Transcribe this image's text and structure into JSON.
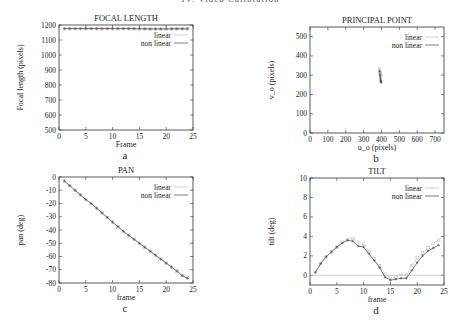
{
  "header": {
    "text": "IV. Video Calibration"
  },
  "chart_data": [
    {
      "id": "focal",
      "type": "line",
      "title": "FOCAL LENGTH",
      "xlabel": "Frame",
      "ylabel": "Focal length (pixels)",
      "caption": "a",
      "xlim": [
        0,
        25
      ],
      "ylim": [
        500,
        1200
      ],
      "xticks": [
        0,
        5,
        10,
        15,
        20,
        25
      ],
      "yticks": [
        500,
        600,
        700,
        800,
        900,
        1000,
        1100,
        1200
      ],
      "grid": false,
      "legend_position": "upper right",
      "frame": {
        "left": 59,
        "right": 193,
        "top": 25,
        "bottom": 130
      },
      "series": [
        {
          "name": "linear",
          "color": "#bbbbbb",
          "x": [
            1,
            2,
            3,
            4,
            5,
            6,
            7,
            8,
            9,
            10,
            11,
            12,
            13,
            14,
            15,
            16,
            17,
            18,
            19,
            20,
            21,
            22,
            23,
            24
          ],
          "y": [
            1175,
            1175,
            1175,
            1175,
            1175,
            1175,
            1175,
            1175,
            1175,
            1175,
            1175,
            1175,
            1175,
            1175,
            1174,
            1174,
            1173,
            1173,
            1173,
            1173,
            1173,
            1174,
            1174,
            1174
          ]
        },
        {
          "name": "non linear",
          "color": "#444444",
          "x": [
            1,
            2,
            3,
            4,
            5,
            6,
            7,
            8,
            9,
            10,
            11,
            12,
            13,
            14,
            15,
            16,
            17,
            18,
            19,
            20,
            21,
            22,
            23,
            24
          ],
          "y": [
            1176,
            1176,
            1176,
            1176,
            1176,
            1176,
            1176,
            1176,
            1176,
            1176,
            1176,
            1176,
            1176,
            1176,
            1175,
            1175,
            1174,
            1174,
            1174,
            1174,
            1175,
            1175,
            1175,
            1175
          ]
        }
      ]
    },
    {
      "id": "principal",
      "type": "scatter",
      "title": "PRINCIPAL POINT",
      "xlabel": "u_o (pixels)",
      "ylabel": "v_o (pixels)",
      "caption": "b",
      "xlim": [
        0,
        750
      ],
      "ylim": [
        0,
        550
      ],
      "xticks": [
        0,
        100,
        200,
        300,
        400,
        500,
        600,
        700
      ],
      "yticks": [
        0,
        100,
        200,
        300,
        400,
        500
      ],
      "grid": false,
      "legend_position": "upper right",
      "frame": {
        "left": 310,
        "right": 444,
        "top": 27,
        "bottom": 133
      },
      "series": [
        {
          "name": "linear",
          "color": "#bbbbbb",
          "x": [
            388,
            390,
            392,
            394,
            395,
            396
          ],
          "y": [
            335,
            325,
            315,
            305,
            300,
            295
          ]
        },
        {
          "name": "non linear",
          "color": "#444444",
          "x": [
            390,
            392,
            394,
            395,
            396,
            397,
            398
          ],
          "y": [
            320,
            300,
            285,
            275,
            270,
            265,
            262
          ]
        }
      ]
    },
    {
      "id": "pan",
      "type": "line",
      "title": "PAN",
      "xlabel": "frame",
      "ylabel": "pan (deg)",
      "caption": "c",
      "xlim": [
        0,
        25
      ],
      "ylim": [
        -80,
        0
      ],
      "xticks": [
        0,
        5,
        10,
        15,
        20,
        25
      ],
      "yticks": [
        0,
        -10,
        -20,
        -30,
        -40,
        -50,
        -60,
        -70,
        -80
      ],
      "grid": false,
      "legend_position": "upper right",
      "frame": {
        "left": 59,
        "right": 193,
        "top": 177,
        "bottom": 283
      },
      "series": [
        {
          "name": "linear",
          "color": "#bbbbbb",
          "x": [
            1,
            2,
            3,
            4,
            5,
            6,
            7,
            8,
            9,
            10,
            11,
            12,
            13,
            14,
            15,
            16,
            17,
            18,
            19,
            20,
            21,
            22,
            23,
            24
          ],
          "y": [
            -3,
            -6.5,
            -10,
            -13.5,
            -17,
            -20,
            -23.5,
            -27,
            -30.5,
            -34,
            -37.5,
            -41,
            -44,
            -47,
            -50,
            -53,
            -56,
            -59,
            -62,
            -65,
            -68,
            -71,
            -74.5,
            -76
          ]
        },
        {
          "name": "non linear",
          "color": "#444444",
          "x": [
            1,
            2,
            3,
            4,
            5,
            6,
            7,
            8,
            9,
            10,
            11,
            12,
            13,
            14,
            15,
            16,
            17,
            18,
            19,
            20,
            21,
            22,
            23,
            24
          ],
          "y": [
            -3,
            -6.5,
            -10,
            -13.5,
            -17,
            -20,
            -23.5,
            -27,
            -30.5,
            -34,
            -37.5,
            -41,
            -44,
            -47,
            -50,
            -53,
            -56,
            -59,
            -62,
            -65,
            -68,
            -71,
            -74.5,
            -76.5
          ]
        }
      ]
    },
    {
      "id": "tilt",
      "type": "line",
      "title": "TILT",
      "xlabel": "frame",
      "ylabel": "tilt (deg)",
      "caption": "d",
      "xlim": [
        0,
        25
      ],
      "ylim": [
        -1,
        10
      ],
      "xticks": [
        0,
        5,
        10,
        15,
        20,
        25
      ],
      "yticks": [
        0,
        2,
        4,
        6,
        8,
        10
      ],
      "grid": false,
      "zero_line": true,
      "legend_position": "upper right",
      "frame": {
        "left": 310,
        "right": 444,
        "top": 178,
        "bottom": 285
      },
      "series": [
        {
          "name": "linear",
          "color": "#bbbbbb",
          "x": [
            1,
            2,
            3,
            4,
            5,
            6,
            7,
            8,
            9,
            10,
            11,
            12,
            13,
            14,
            15,
            16,
            17,
            18,
            19,
            20,
            21,
            22,
            23,
            24
          ],
          "y": [
            0.3,
            1.2,
            1.9,
            2.4,
            2.9,
            3.4,
            3.7,
            3.8,
            3.4,
            3.2,
            2.4,
            1.7,
            1.0,
            0.1,
            -0.3,
            -0.2,
            0.1,
            0.0,
            1.0,
            1.8,
            2.3,
            2.8,
            3.3,
            3.6
          ]
        },
        {
          "name": "non linear",
          "color": "#444444",
          "x": [
            1,
            2,
            3,
            4,
            5,
            6,
            7,
            8,
            9,
            10,
            11,
            12,
            13,
            14,
            15,
            16,
            17,
            18,
            19,
            20,
            21,
            22,
            23,
            24
          ],
          "y": [
            0.3,
            1.2,
            1.9,
            2.4,
            2.9,
            3.3,
            3.6,
            3.5,
            3.0,
            2.9,
            2.2,
            1.5,
            0.8,
            -0.2,
            -0.5,
            -0.4,
            -0.3,
            -0.3,
            0.5,
            1.3,
            2.0,
            2.5,
            2.8,
            3.1
          ]
        }
      ]
    }
  ]
}
